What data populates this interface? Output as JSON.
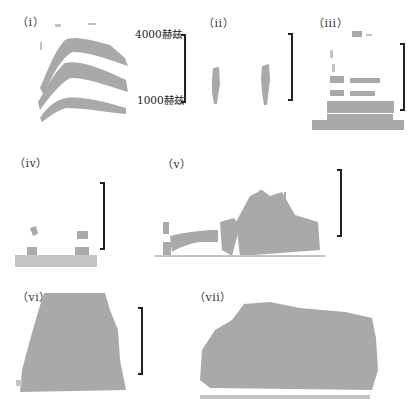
{
  "figure": {
    "panels": [
      {
        "id": "i",
        "label": "（i）"
      },
      {
        "id": "ii",
        "label": "（ii）"
      },
      {
        "id": "iii",
        "label": "（iii）"
      },
      {
        "id": "iv",
        "label": "（iv）"
      },
      {
        "id": "v",
        "label": "（v）"
      },
      {
        "id": "vi",
        "label": "（vi）"
      },
      {
        "id": "vii",
        "label": "（vii）"
      }
    ],
    "scale_bar": {
      "top_label": "4000赫兹",
      "bottom_label": "1000赫兹"
    },
    "colors": {
      "spectrogram": "#a9a9a9",
      "scale_bar": "#222222",
      "background": "#ffffff"
    }
  }
}
